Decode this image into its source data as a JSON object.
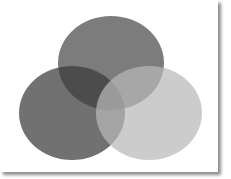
{
  "diagram": {
    "type": "venn",
    "sets": [
      {
        "id": "top",
        "label": "",
        "cx": 111,
        "cy": 63,
        "rx": 53,
        "ry": 47,
        "fill": "#4a4a4a",
        "opacity": 0.72
      },
      {
        "id": "left",
        "label": "",
        "cx": 72,
        "cy": 113,
        "rx": 53,
        "ry": 47,
        "fill": "#3a3a3a",
        "opacity": 0.72
      },
      {
        "id": "right",
        "label": "",
        "cx": 149,
        "cy": 113,
        "rx": 53,
        "ry": 47,
        "fill": "#b9b9b9",
        "opacity": 0.72
      }
    ],
    "background": "#ffffff"
  }
}
